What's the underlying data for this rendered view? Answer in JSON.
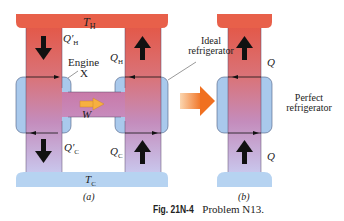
{
  "diagram_a": {
    "hot_reservoir_label": "T",
    "hot_reservoir_sub": "H",
    "cold_reservoir_label": "T",
    "cold_reservoir_sub": "C",
    "engine_label": "Engine",
    "engine_id": "X",
    "fridge_label_line1": "Ideal",
    "fridge_label_line2": "refrigerator",
    "q_h_prime": "Q′",
    "q_h_prime_sub": "H",
    "q_h": "Q",
    "q_h_sub": "H",
    "q_c_prime": "Q′",
    "q_c_prime_sub": "C",
    "q_c": "Q",
    "q_c_sub": "C",
    "work": "W",
    "panel_label": "(a)"
  },
  "diagram_b": {
    "q_top": "Q",
    "q_bottom": "Q",
    "label_line1": "Perfect",
    "label_line2": "refrigerator",
    "panel_label": "(b)"
  },
  "caption": {
    "fig": "Fig. 21N-4",
    "text": "Problem N13."
  },
  "colors": {
    "hot": "#e8604a",
    "cold": "#a9c9ec",
    "mix": "#c98fb9",
    "work_arrow": "#f4a030",
    "transform_arrow": "#f07a2a"
  }
}
